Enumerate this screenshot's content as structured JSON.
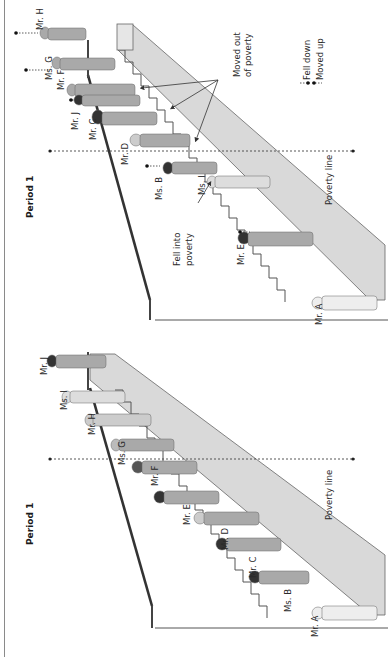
{
  "figure": {
    "orientation": "rotated 90deg counter-clockwise",
    "legend": {
      "fell_down": "Fell down",
      "moved_up": "Moved up"
    },
    "colors": {
      "stair_fill": "#d9d9d9",
      "stair_edge": "#555555",
      "railing": "#3a3a3a",
      "poverty_line": "#444444",
      "text": "#2a2a2a"
    }
  },
  "panels": [
    {
      "id": "bottom",
      "title": "Period 1",
      "poverty_line_label": "Poverty line",
      "people": [
        {
          "label": "Mr. A"
        },
        {
          "label": "Ms. B"
        },
        {
          "label": "Mr. C"
        },
        {
          "label": "Mr. D"
        },
        {
          "label": "Mr. E"
        },
        {
          "label": "Mr. F"
        },
        {
          "label": "Ms. G"
        },
        {
          "label": "Mr. H"
        },
        {
          "label": "Ms. I"
        },
        {
          "label": "Mr. J"
        }
      ]
    },
    {
      "id": "top",
      "title": "Period 1",
      "poverty_line_label": "Poverty line",
      "annotations": {
        "moved_out": [
          "Moved out",
          "of poverty"
        ],
        "fell_into": [
          "Fell into",
          "poverty"
        ]
      },
      "people": [
        {
          "label": "Mr. A",
          "change": "none"
        },
        {
          "label": "Mr. E",
          "change": "fell down"
        },
        {
          "label": "Ms. I",
          "change": "fell into poverty"
        },
        {
          "label": "Ms. B",
          "change": "moved up"
        },
        {
          "label": "Mr. D",
          "change": "none"
        },
        {
          "label": "Mr. C",
          "change": "moved out of poverty"
        },
        {
          "label": "Mr. J",
          "change": "moved up"
        },
        {
          "label": "Mr. F",
          "change": "moved out of poverty"
        },
        {
          "label": "Ms. G",
          "change": "moved up"
        },
        {
          "label": "Mr. H",
          "change": "moved up"
        }
      ]
    }
  ]
}
